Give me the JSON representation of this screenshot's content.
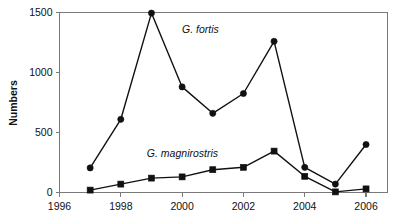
{
  "chart_data": {
    "type": "line",
    "title": "",
    "xlabel": "",
    "ylabel": "Numbers",
    "x": [
      1997,
      1998,
      1999,
      2000,
      2001,
      2002,
      2003,
      2004,
      2005,
      2006
    ],
    "xlim": [
      1996,
      2006.7
    ],
    "ylim": [
      0,
      1500
    ],
    "xticks": [
      1996,
      1998,
      2000,
      2002,
      2004,
      2006
    ],
    "xtick_labels": [
      "1996",
      "1998",
      "2000",
      "2002",
      "2004",
      "2006"
    ],
    "yticks": [
      0,
      500,
      1000,
      1500
    ],
    "ytick_labels": [
      "0",
      "500",
      "1000",
      "1500"
    ],
    "grid": false,
    "legend_position": "inline-annotation",
    "series": [
      {
        "name": "G. fortis",
        "marker": "circle",
        "color": "#111111",
        "label_x": 2000.0,
        "label_y": 1330,
        "values": [
          205,
          610,
          1495,
          880,
          660,
          825,
          1260,
          210,
          70,
          400
        ]
      },
      {
        "name": "G. magnirostris",
        "marker": "square",
        "color": "#111111",
        "label_x": 1998.85,
        "label_y": 300,
        "values": [
          20,
          70,
          120,
          130,
          190,
          210,
          345,
          135,
          5,
          30
        ]
      }
    ],
    "annotations": [
      {
        "text": "G. fortis",
        "x": 2000.0,
        "y": 1330
      },
      {
        "text": "G. magnirostris",
        "x": 1998.85,
        "y": 300
      }
    ]
  }
}
